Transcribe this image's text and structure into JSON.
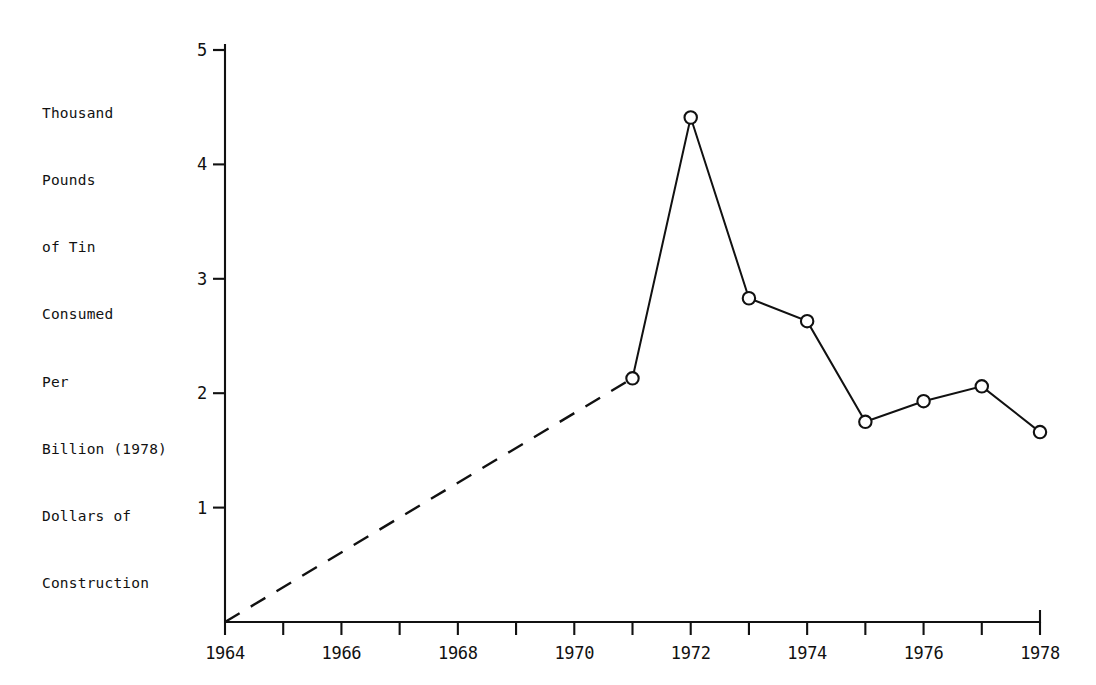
{
  "chart_data": {
    "type": "line",
    "title": "",
    "subtitle": "",
    "xlabel": "",
    "ylabel": "Thousand Pounds of Tin Consumed Per Billion (1978) Dollars of Construction",
    "ylabel_lines": [
      "Thousand",
      "Pounds",
      "of Tin",
      "Consumed",
      "Per",
      "Billion (1978)",
      "Dollars of",
      "Construction"
    ],
    "xlim": [
      1964,
      1978
    ],
    "ylim": [
      0,
      5
    ],
    "grid": false,
    "legend": null,
    "x_tick_values": [
      1964,
      1965,
      1966,
      1967,
      1968,
      1969,
      1970,
      1971,
      1972,
      1973,
      1974,
      1975,
      1976,
      1977,
      1978
    ],
    "x_tick_labels": [
      "1964",
      "",
      "1966",
      "",
      "1968",
      "",
      "1970",
      "",
      "1972",
      "",
      "1974",
      "",
      "1976",
      "",
      "1978"
    ],
    "y_tick_values": [
      1,
      2,
      3,
      4,
      5
    ],
    "y_tick_labels": [
      "1",
      "2",
      "3",
      "4",
      "5"
    ],
    "series": [
      {
        "name": "Tin consumed per billion dollars of construction",
        "marker": "open-circle",
        "x": [
          1971,
          1972,
          1973,
          1974,
          1975,
          1976,
          1977,
          1978
        ],
        "values": [
          2.13,
          4.41,
          2.83,
          2.63,
          1.75,
          1.93,
          2.06,
          1.66
        ]
      },
      {
        "name": "Interpolated trend 1964-1971",
        "style": "dashed",
        "marker": "none",
        "x": [
          1964,
          1971
        ],
        "values": [
          0,
          2.13
        ]
      }
    ],
    "annotations": []
  },
  "figure": {
    "background_color": "#ffffff",
    "line_color": "#111111",
    "marker_fill": "#ffffff"
  }
}
